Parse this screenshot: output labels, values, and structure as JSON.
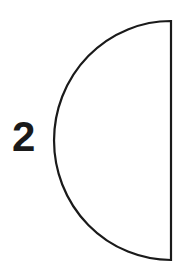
{
  "diagram": {
    "label": "2",
    "shape": {
      "type": "semicircle",
      "orientation": "curved-side-left",
      "stroke_color": "#1a1a1a",
      "fill_color": "#ffffff"
    }
  }
}
